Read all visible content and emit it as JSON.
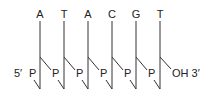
{
  "diagram": {
    "bases": [
      "A",
      "T",
      "A",
      "C",
      "G",
      "T"
    ],
    "phosphate_label": "P",
    "five_prime_label": "5′",
    "three_prime_end_label": "OH 3′",
    "colors": {
      "line": "#333333",
      "text": "#222222",
      "background": "#ffffff"
    }
  }
}
